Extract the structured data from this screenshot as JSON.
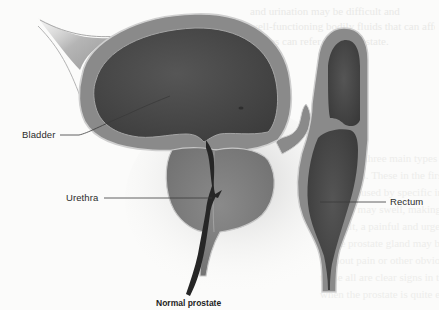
{
  "figure": {
    "caption": "Normal prostate",
    "labels": {
      "bladder": "Bladder",
      "urethra": "Urethra",
      "rectum": "Rectum"
    },
    "colors": {
      "background": "#fbfbfa",
      "wall": "#8c8c8c",
      "wall_edge": "#bdbdbd",
      "lumen": "#4a4a4a",
      "prostate": "#7d7d7d",
      "urethra": "#2a2a2a",
      "label_text": "#2b2b2b",
      "leader_line": "#3a3a3a"
    }
  },
  "bleed_through": {
    "top_lines": [
      "and urination may be difficult and",
      "well-functioning bodily fluids that can affect",
      "tissues can refer to the prostate."
    ],
    "lower_lines": [
      "There are three main types of prostate",
      "conditions. These in the first place",
      "can be caused by specific infection, the",
      "prostate may swell, making urination",
      "difficult, a painful and urgent or",
      "of the prostate gland may be inflamed",
      "without pain or other obvious symptoms",
      "these all are clear signs in this",
      "when the prostate is quite enlarged",
      "with no evident no diagnosis.",
      "Which disorders of the prostate"
    ]
  }
}
